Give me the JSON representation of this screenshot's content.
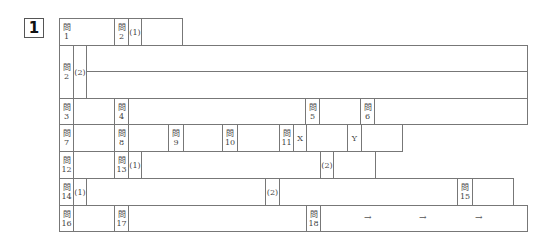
{
  "section": {
    "number": "1"
  },
  "q_prefix": "問",
  "rows": {
    "r1": {
      "q1": "1",
      "q2": "2",
      "q2_sub": "(1)"
    },
    "r2": {
      "q2": "2",
      "sub": "(2)"
    },
    "r3": {
      "q3": "3",
      "q4": "4",
      "q5": "5",
      "q6": "6"
    },
    "r4": {
      "q7": "7",
      "q8": "8",
      "q9": "9",
      "q10": "10",
      "q11": "11",
      "x": "X",
      "y": "Y"
    },
    "r5": {
      "q12": "12",
      "q13": "13",
      "sub1": "(1)",
      "sub2": "(2)"
    },
    "r6": {
      "q14": "14",
      "sub1": "(1)",
      "sub2": "(2)",
      "q15": "15"
    },
    "r7": {
      "q16": "16",
      "q17": "17",
      "q18": "18",
      "arrows": [
        "→",
        "→",
        "→"
      ]
    }
  }
}
